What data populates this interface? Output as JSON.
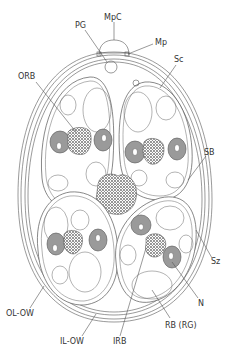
{
  "diagram": {
    "labels": [
      {
        "id": "PG",
        "text": "PG",
        "x": 61,
        "y": 26
      },
      {
        "id": "MpC",
        "text": "MpC",
        "x": 103,
        "y": 20
      },
      {
        "id": "Mp",
        "text": "Mp",
        "x": 155,
        "y": 45
      },
      {
        "id": "Sc",
        "text": "Sc",
        "x": 176,
        "y": 62
      },
      {
        "id": "ORB",
        "text": "ORB",
        "x": 18,
        "y": 79
      },
      {
        "id": "SB",
        "text": "SB",
        "x": 204,
        "y": 155
      },
      {
        "id": "Sz",
        "text": "Sz",
        "x": 211,
        "y": 262
      },
      {
        "id": "N",
        "text": "N",
        "x": 198,
        "y": 304
      },
      {
        "id": "OL-OW",
        "text": "OL-OW",
        "x": 6,
        "y": 314
      },
      {
        "id": "IL-OW",
        "text": "IL-OW",
        "x": 60,
        "y": 342
      },
      {
        "id": "IRB",
        "text": "IRB",
        "x": 112,
        "y": 342
      },
      {
        "id": "RB (RG)",
        "text": "RB (RG)",
        "x": 165,
        "y": 326
      }
    ],
    "colors": {
      "outline": "#555555",
      "nucleus": "#9a9a9a",
      "refractile": "#777777",
      "background": "#ffffff"
    }
  }
}
